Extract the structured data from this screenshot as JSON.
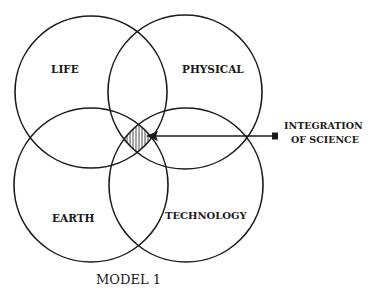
{
  "diagram": {
    "type": "venn",
    "title": "MODEL 1",
    "sets": [
      {
        "label": "LIFE"
      },
      {
        "label": "PHYSICAL"
      },
      {
        "label": "EARTH"
      },
      {
        "label": "TECHNOLOGY"
      }
    ],
    "callout": {
      "line1": "INTEGRATION",
      "line2": "OF SCIENCE"
    },
    "colors": {
      "stroke": "#1a1a1a",
      "background": "#ffffff"
    }
  }
}
